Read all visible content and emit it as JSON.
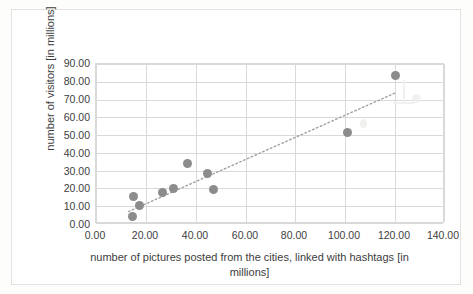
{
  "chart_data": {
    "type": "scatter",
    "title": "",
    "xlabel": "number of pictures posted from the cities, linked with hashtags [in millions]",
    "ylabel": "number of visitors [in millions]",
    "xlim": [
      0,
      140
    ],
    "ylim": [
      0,
      90
    ],
    "xticks": [
      "0.00",
      "20.00",
      "40.00",
      "60.00",
      "80.00",
      "100.00",
      "120.00",
      "140.00"
    ],
    "xtick_values": [
      0,
      20,
      40,
      60,
      80,
      100,
      120,
      140
    ],
    "yticks": [
      "0.00",
      "10.00",
      "20.00",
      "30.00",
      "40.00",
      "50.00",
      "60.00",
      "70.00",
      "80.00",
      "90.00"
    ],
    "ytick_values": [
      0,
      10,
      20,
      30,
      40,
      50,
      60,
      70,
      80,
      90
    ],
    "grid": "horizontal-and-vertical",
    "legend": "none",
    "marker_color": "#8c8c8c",
    "gridline_color": "#d9d9d9",
    "points": [
      {
        "x": 14.5,
        "y": 4.3
      },
      {
        "x": 15.0,
        "y": 15.4
      },
      {
        "x": 17.6,
        "y": 10.2
      },
      {
        "x": 26.6,
        "y": 18.0
      },
      {
        "x": 31.2,
        "y": 20.2
      },
      {
        "x": 36.6,
        "y": 34.0
      },
      {
        "x": 44.6,
        "y": 28.5
      },
      {
        "x": 47.2,
        "y": 19.5
      },
      {
        "x": 101.0,
        "y": 51.3
      },
      {
        "x": 120.0,
        "y": 83.5
      }
    ],
    "trendline": {
      "style": "dotted",
      "color": "#a0a0a0",
      "x_start": 13.0,
      "y_start": 7.0,
      "x_end": 120.5,
      "y_end": 74.0
    }
  },
  "axes": {
    "y_title": "number of visitors [in millions]",
    "x_title": "number of pictures posted from the cities, linked with hashtags [in millions]"
  }
}
